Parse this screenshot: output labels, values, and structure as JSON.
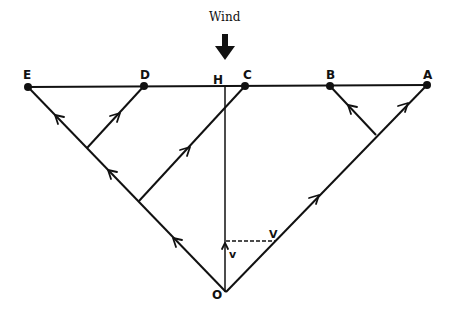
{
  "diagram": {
    "wind_label": "Wind",
    "points": {
      "E": {
        "label": "E",
        "x": 28,
        "y": 87
      },
      "D": {
        "label": "D",
        "x": 144,
        "y": 86
      },
      "H": {
        "label": "H",
        "x": 225,
        "y": 86
      },
      "C": {
        "label": "C",
        "x": 245,
        "y": 86
      },
      "B": {
        "label": "B",
        "x": 330,
        "y": 86
      },
      "A": {
        "label": "A",
        "x": 427,
        "y": 85
      },
      "O": {
        "label": "O",
        "x": 226,
        "y": 292
      }
    },
    "velocity_labels": {
      "small_v": "v",
      "large_V": "V"
    },
    "lines": [
      {
        "name": "top-line-EA",
        "from": "E",
        "to": "A"
      },
      {
        "name": "line-OE",
        "from": "O",
        "to": "E"
      },
      {
        "name": "line-OA",
        "from": "O",
        "to": "A"
      },
      {
        "name": "vertical-OH",
        "from": "O",
        "to": "H"
      },
      {
        "name": "branch-to-D",
        "from": [
          87,
          148
        ],
        "to": "D"
      },
      {
        "name": "branch-to-C",
        "from": [
          139,
          201
        ],
        "to": "C"
      },
      {
        "name": "branch-to-B",
        "from": [
          376,
          135
        ],
        "to": "B"
      }
    ],
    "dashed_line": {
      "from": [
        226,
        241
      ],
      "to": [
        275,
        241
      ]
    },
    "colors": {
      "ink": "#111111",
      "background": "#ffffff"
    }
  }
}
